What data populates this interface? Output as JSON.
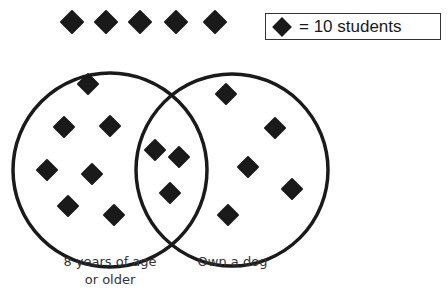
{
  "legend": {
    "symbol": "diamond",
    "text": "= 10 students"
  },
  "sets": [
    {
      "label_line1": "8 years of age",
      "label_line2": "or older",
      "only_count_symbols": 7
    },
    {
      "label": "Own a dog",
      "only_count_symbols": 5
    }
  ],
  "intersection_symbols": 3,
  "outside_symbols": 5,
  "colors": {
    "ink": "#1a1a1a",
    "background": "#ffffff"
  },
  "points": {
    "outside": [
      [
        72,
        22
      ],
      [
        106,
        22
      ],
      [
        140,
        22
      ],
      [
        176,
        22
      ],
      [
        215,
        22
      ]
    ],
    "left_only": [
      [
        88,
        84
      ],
      [
        64,
        127
      ],
      [
        110,
        126
      ],
      [
        47,
        170
      ],
      [
        92,
        174
      ],
      [
        68,
        206
      ],
      [
        114,
        215
      ]
    ],
    "both": [
      [
        155,
        150
      ],
      [
        179,
        157
      ],
      [
        170,
        193
      ]
    ],
    "right_only": [
      [
        226,
        94
      ],
      [
        275,
        128
      ],
      [
        248,
        167
      ],
      [
        292,
        189
      ],
      [
        228,
        215
      ]
    ]
  }
}
